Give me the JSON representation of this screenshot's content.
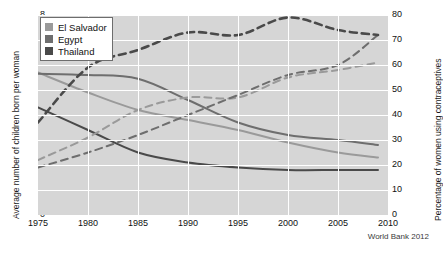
{
  "chart_data": {
    "type": "line",
    "title": "",
    "xlabel": "",
    "ylabel": "Average number of children born per woman",
    "y2label": "Percentage of women using contraceptives",
    "xlim": [
      1975,
      2010
    ],
    "ylim": [
      0,
      8
    ],
    "y2lim": [
      0,
      80
    ],
    "xticks": [
      "1975",
      "1980",
      "1985",
      "1990",
      "1995",
      "2000",
      "2005",
      "2010"
    ],
    "yticks": [
      "0",
      "1",
      "2",
      "3",
      "4",
      "5",
      "6",
      "7",
      "8"
    ],
    "y2ticks": [
      "0",
      "10",
      "20",
      "30",
      "40",
      "50",
      "60",
      "70",
      "80"
    ],
    "grid": true,
    "legend_position": "top-left",
    "legend": [
      "El Salvador",
      "Egypt",
      "Thailand"
    ],
    "colors": {
      "el_salvador": "#9a9a9a",
      "egypt": "#6e6e6e",
      "thailand": "#4a4a4a",
      "plot_background": "#d6d6d6",
      "gridline": "#ffffff"
    },
    "series": [
      {
        "name": "El Salvador",
        "axis": "left",
        "style": "solid",
        "measure": "Average number of children born per woman",
        "x": [
          1975,
          1980,
          1985,
          1990,
          1995,
          2000,
          2005,
          2009
        ],
        "values": [
          5.7,
          4.9,
          4.2,
          3.8,
          3.4,
          2.9,
          2.5,
          2.3
        ]
      },
      {
        "name": "Egypt",
        "axis": "left",
        "style": "solid",
        "measure": "Average number of children born per woman",
        "x": [
          1975,
          1980,
          1985,
          1990,
          1995,
          2000,
          2005,
          2009
        ],
        "values": [
          5.65,
          5.6,
          5.45,
          4.6,
          3.7,
          3.2,
          3.0,
          2.8
        ]
      },
      {
        "name": "Thailand",
        "axis": "left",
        "style": "solid",
        "measure": "Average number of children born per woman",
        "x": [
          1975,
          1980,
          1985,
          1990,
          1995,
          2000,
          2005,
          2009
        ],
        "values": [
          4.3,
          3.4,
          2.5,
          2.1,
          1.9,
          1.8,
          1.8,
          1.8
        ]
      },
      {
        "name": "El Salvador",
        "axis": "right",
        "style": "dashed",
        "measure": "Percentage of women using contraceptives",
        "x": [
          1975,
          1980,
          1985,
          1990,
          1995,
          2000,
          2005,
          2009
        ],
        "values": [
          22,
          31,
          42,
          47,
          47,
          55,
          58,
          61
        ]
      },
      {
        "name": "Egypt",
        "axis": "right",
        "style": "dashed",
        "measure": "Percentage of women using contraceptives",
        "x": [
          1975,
          1980,
          1985,
          1990,
          1995,
          2000,
          2005,
          2009
        ],
        "values": [
          19,
          25,
          32,
          40,
          48,
          56,
          60,
          72
        ]
      },
      {
        "name": "Thailand",
        "axis": "right",
        "style": "dashed",
        "measure": "Percentage of women using contraceptives",
        "x": [
          1975,
          1980,
          1985,
          1990,
          1995,
          2000,
          2005,
          2009
        ],
        "values": [
          37,
          59,
          66,
          73,
          72,
          79,
          74,
          72
        ]
      }
    ],
    "source": "World Bank 2012"
  }
}
